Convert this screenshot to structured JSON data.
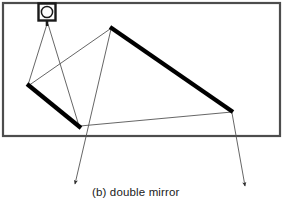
{
  "figure": {
    "caption": "(b) double mirror",
    "enclosure": {
      "name": "room-boundary-rectangle",
      "x": 3,
      "y": 3,
      "width": 277,
      "height": 133,
      "stroke": "#4d4d4d",
      "stroke_width": 2.2,
      "fill": "none"
    },
    "source": {
      "name": "camera-projector",
      "label": "",
      "center_x": 47,
      "center_y": 12,
      "box_size": 17,
      "lens_radius": 5.6,
      "stem_x": 47,
      "stem_top": 20,
      "stem_bottom": 26,
      "stroke": "#1a1a1a"
    },
    "mirrors": [
      {
        "name": "mirror-left",
        "x1": 27,
        "y1": 84,
        "x2": 81,
        "y2": 128,
        "stroke": "#000000",
        "stroke_width": 4.2
      },
      {
        "name": "mirror-right",
        "x1": 110,
        "y1": 27,
        "x2": 233,
        "y2": 112,
        "stroke": "#000000",
        "stroke_width": 4.2
      }
    ],
    "rays": [
      {
        "name": "ray-source-to-mirror-left-top",
        "points": "47,24 28,85",
        "stroke": "#555555",
        "stroke_width": 0.9
      },
      {
        "name": "ray-source-to-mirror-left-bottom",
        "points": "48,24 79,126",
        "stroke": "#555555",
        "stroke_width": 0.9
      },
      {
        "name": "ray-mirror-left-top-to-mirror-right-top",
        "points": "28,86 110,29",
        "stroke": "#555555",
        "stroke_width": 0.9
      },
      {
        "name": "ray-mirror-left-bottom-to-mirror-right-bottom",
        "points": "80,126 232,112",
        "stroke": "#555555",
        "stroke_width": 0.9
      }
    ],
    "output_rays": [
      {
        "name": "output-ray-left-with-arrow",
        "x1": 111,
        "y1": 29,
        "x2": 75,
        "y2": 184,
        "stroke": "#555555",
        "stroke_width": 0.9,
        "arrow": "arrowhead-down-left"
      },
      {
        "name": "output-ray-right-with-arrow",
        "x1": 232,
        "y1": 113,
        "x2": 245,
        "y2": 186,
        "stroke": "#555555",
        "stroke_width": 0.9,
        "arrow": "arrowhead-down-right"
      }
    ],
    "caption_position": {
      "x": 92,
      "y": 196
    }
  }
}
